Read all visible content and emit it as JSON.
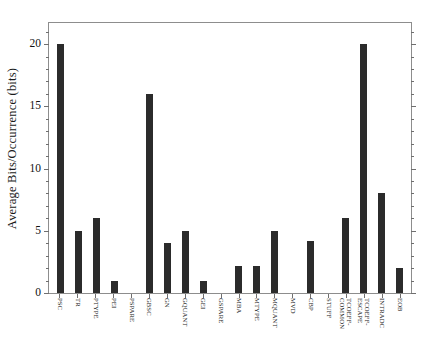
{
  "chart_data": {
    "type": "bar",
    "title": "",
    "subtitle": "",
    "xlabel": "",
    "ylabel": "Average  Bits/Occurrence  (bits)",
    "ylim": [
      0,
      21.7
    ],
    "yticks": [
      0,
      5,
      10,
      15,
      20
    ],
    "ytick_labels": [
      "0",
      "5",
      "10",
      "15",
      "20"
    ],
    "grid": false,
    "legend": null,
    "bar_color": "#2b2b2b",
    "frame_color": "#8d8d8d",
    "categories": [
      "PSC",
      "TR",
      "PTYPE",
      "PEI",
      "PSPARE",
      "GBSC",
      "GN",
      "GQUANT",
      "GEI",
      "GSPARE",
      "MBA",
      "MTYPE",
      "MQUANT",
      "MVD",
      "CBP",
      "STUFF",
      "TCOEFF-\nCOMMON",
      "TCOEFF-\nESCAPE",
      "INTRADC",
      "EOB"
    ],
    "values": [
      20,
      5,
      6,
      1,
      0,
      16,
      4,
      5,
      1,
      0,
      2.2,
      2.2,
      5,
      0,
      4.2,
      0,
      6,
      20,
      8,
      2
    ],
    "value_labels": [
      "20",
      "5",
      "6",
      "1",
      "0",
      "16",
      "4",
      "5",
      "1",
      "0",
      "2.2",
      "2.2",
      "5",
      "0",
      "4.2",
      "0",
      "6",
      "20",
      "8",
      "2"
    ]
  }
}
